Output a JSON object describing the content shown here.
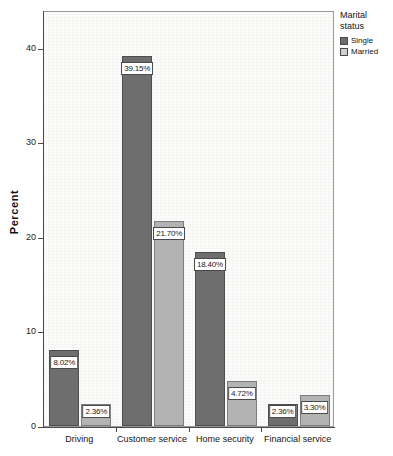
{
  "chart_data": {
    "type": "bar",
    "title": "",
    "subtitle": "",
    "xlabel": "",
    "ylabel": "Percent",
    "ylim": [
      0,
      44
    ],
    "yticks": [
      "0",
      "10",
      "20",
      "30",
      "40"
    ],
    "ytick_values": [
      0,
      10,
      20,
      30,
      40
    ],
    "grid": false,
    "legend_position": "right",
    "legend_title": "Marital status",
    "categories": [
      "Driving",
      "Customer service",
      "Home security",
      "Financial service"
    ],
    "series": [
      {
        "name": "Single",
        "color": "#6e6e6e",
        "values": [
          8.02,
          39.15,
          18.4,
          2.36
        ],
        "labels": [
          "8.02%",
          "39.15%",
          "18.40%",
          "2.36%"
        ]
      },
      {
        "name": "Married",
        "color": "#b3b3b3",
        "values": [
          2.36,
          21.7,
          4.72,
          3.3
        ],
        "labels": [
          "2.36%",
          "21.70%",
          "4.72%",
          "3.30%"
        ]
      }
    ]
  },
  "legend": {
    "title_line1": "Marital",
    "title_line2": "status",
    "entries": [
      {
        "label": "Single",
        "swatch": "#6e6e6e"
      },
      {
        "label": "Married",
        "swatch": "#cfcfcf"
      }
    ]
  },
  "axes": {
    "y_title": "Percent",
    "y_tick_labels": [
      "40",
      "30",
      "20",
      "10",
      "0"
    ],
    "x_tick_labels": [
      "Driving",
      "Customer service",
      "Home security",
      "Financial service"
    ]
  },
  "colors": {
    "single": "#6e6e6e",
    "married": "#b3b3b3",
    "frame": "#9a9a9a",
    "axis": "#4a4a4a",
    "plot_background": "#fbfbfa",
    "label_background": "#ffffff"
  }
}
